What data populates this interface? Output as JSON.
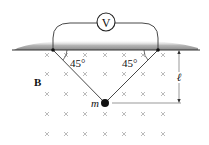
{
  "diagram": {
    "meter_label": "V",
    "left_angle": "45°",
    "right_angle": "45°",
    "field_label": "B",
    "mass_label": "m",
    "length_label": "ℓ",
    "field_symbol": "×",
    "colors": {
      "ink": "#222222",
      "ceiling_shade": "#9a9a9a",
      "field_marks": "#a8a8a8"
    }
  }
}
